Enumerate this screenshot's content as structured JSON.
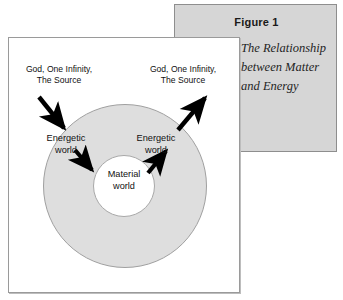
{
  "figure": {
    "caption_title": "Figure 1",
    "caption_body": "The Relationship between Matter and Energy",
    "scan_artifact": "",
    "colors": {
      "caption_panel_bg": "#d6d6d6",
      "caption_panel_border": "#8e8e8e",
      "frame_bg": "#ffffff",
      "frame_border": "#9a9a9a",
      "outer_circle_fill": "#dedede",
      "outer_circle_stroke": "#a0a0a0",
      "inner_circle_fill": "#ffffff",
      "inner_circle_stroke": "#a8a8a8",
      "arrow_color": "#000000",
      "text_color": "#111111"
    }
  },
  "diagram": {
    "labels": {
      "source_left": "God, One Infinity,\nThe Source",
      "source_right": "God, One Infinity,\nThe Source",
      "energetic_left": "Energetic\nworld",
      "energetic_right": "Energetic\nworld",
      "material_center": "Material\nworld"
    },
    "regions": [
      {
        "name": "outer-ring",
        "label": "Energetic world",
        "fill": "#dedede"
      },
      {
        "name": "inner-disc",
        "label": "Material world",
        "fill": "#ffffff"
      }
    ],
    "arrows": [
      {
        "name": "arrow-source-to-energetic-left",
        "direction": "inward",
        "from": "God, One Infinity, The Source",
        "to": "Energetic world"
      },
      {
        "name": "arrow-energetic-to-source-right",
        "direction": "outward",
        "from": "Energetic world",
        "to": "God, One Infinity, The Source"
      },
      {
        "name": "arrow-energetic-to-material-left",
        "direction": "inward",
        "from": "Energetic world",
        "to": "Material world"
      },
      {
        "name": "arrow-material-to-energetic-right",
        "direction": "outward",
        "from": "Material world",
        "to": "Energetic world"
      }
    ]
  }
}
